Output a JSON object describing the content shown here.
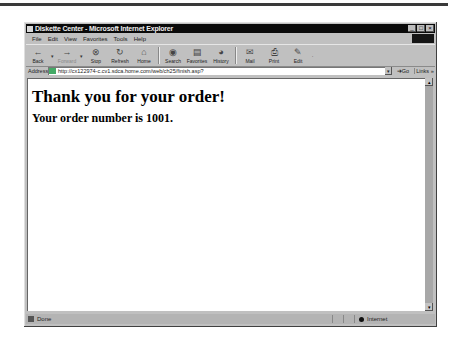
{
  "window": {
    "title": "Diskette Center - Microsoft Internet Explorer",
    "controls": [
      "_",
      "□",
      "×"
    ]
  },
  "menubar": {
    "items": [
      "File",
      "Edit",
      "View",
      "Favorites",
      "Tools",
      "Help"
    ]
  },
  "toolbar": {
    "buttons": [
      {
        "label": "Back",
        "icon": "←"
      },
      {
        "label": "Forward",
        "icon": "→"
      },
      {
        "label": "Stop",
        "icon": "⊗"
      },
      {
        "label": "Refresh",
        "icon": "↻"
      },
      {
        "label": "Home",
        "icon": "⌂"
      },
      {
        "label": "Search",
        "icon": "◉"
      },
      {
        "label": "Favorites",
        "icon": "▤"
      },
      {
        "label": "History",
        "icon": "◕"
      },
      {
        "label": "Mail",
        "icon": "✉"
      },
      {
        "label": "Print",
        "icon": "⎙"
      },
      {
        "label": "Edit",
        "icon": "✎"
      }
    ]
  },
  "addressbar": {
    "label": "Address",
    "url": "http://cx122974-c.cv1.sdca.home.com/web/ch25/finish.asp?",
    "go_label": "Go",
    "links_label": "Links »"
  },
  "page": {
    "heading": "Thank you for your order!",
    "order_text": "Your order number is 1001."
  },
  "statusbar": {
    "status": "Done",
    "zone": "Internet"
  }
}
